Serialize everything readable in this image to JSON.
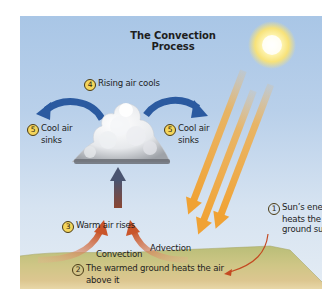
{
  "diagram": {
    "title": "The Convection Process",
    "colors": {
      "sky_top": "#a9c6e6",
      "sky_bottom": "#e4ecf4",
      "sun": "#fff6b0",
      "sun_rays": "#f2a93b",
      "cool_air_arrows": "#2b5aa0",
      "warm_air_arrows": "#c8572a",
      "step_marker": "#f4d55c",
      "ground": "#c9c183"
    },
    "steps": [
      {
        "number": "1",
        "text_line1": "Sun’s energy",
        "text_line2": "heats the",
        "text_line3": "ground surface"
      },
      {
        "number": "2",
        "text_line1": "The warmed ground heats the air",
        "text_line2": "above it"
      },
      {
        "number": "3",
        "text_line1": "Warm air rises"
      },
      {
        "number": "4",
        "text_line1": "Rising air cools"
      },
      {
        "number": "5",
        "text_line1": "Cool air",
        "text_line2": "sinks"
      },
      {
        "number": "5",
        "text_line1": "Cool air",
        "text_line2": "sinks"
      }
    ],
    "process_labels": {
      "convection": "Convection",
      "advection": "Advection"
    },
    "icons": {
      "sun": "sun-icon",
      "cloud": "cloud-icon"
    }
  }
}
